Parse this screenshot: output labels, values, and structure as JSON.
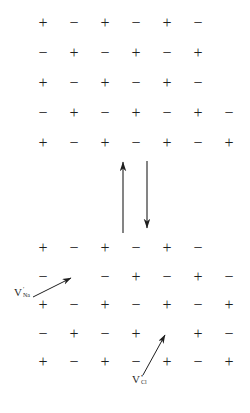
{
  "figure": {
    "background": "#ffffff",
    "ink": "#1f1f1f",
    "plus": "+",
    "minus": "−",
    "top_lattice": {
      "rows": [
        [
          "+",
          "−",
          "+",
          "−",
          "+",
          "−"
        ],
        [
          "−",
          "+",
          "−",
          "+",
          "−",
          "+"
        ],
        [
          "+",
          "−",
          "+",
          "−",
          "+",
          "−"
        ],
        [
          "−",
          "+",
          "−",
          "+",
          "−",
          "+",
          "−"
        ],
        [
          "+",
          "−",
          "+",
          "−",
          "+",
          "−",
          "+"
        ]
      ]
    },
    "bottom_lattice": {
      "rows": [
        [
          "+",
          "−",
          "+",
          "−",
          "+",
          "−"
        ],
        [
          "−",
          "",
          "−",
          "+",
          "−",
          "+",
          "−"
        ],
        [
          "+",
          "−",
          "+",
          "−",
          "+",
          "−",
          "+"
        ],
        [
          "−",
          "+",
          "−",
          "+",
          "",
          "+",
          "−"
        ],
        [
          "+",
          "−",
          "+",
          "−",
          "+",
          "−",
          "+"
        ]
      ],
      "vacancies": [
        {
          "row": 2,
          "col": 2,
          "missing": "+",
          "kind": "cation-vacancy"
        },
        {
          "row": 4,
          "col": 5,
          "missing": "−",
          "kind": "anion-vacancy"
        }
      ]
    },
    "labels": {
      "na_vacancy": {
        "base": "V",
        "sup": "′",
        "sub": "Na"
      },
      "cl_vacancy": {
        "base": "V",
        "sup": "•",
        "sub": "Cl"
      }
    }
  }
}
